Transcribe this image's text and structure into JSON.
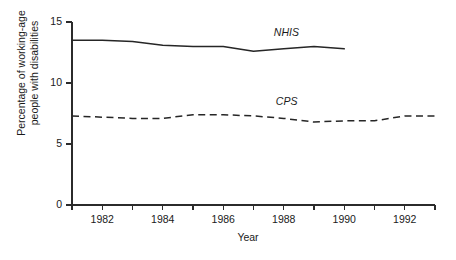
{
  "chart_data": {
    "type": "line",
    "title": "",
    "xlabel": "Year",
    "ylabel_line1": "Percentage of working-age",
    "ylabel_line2": "people with disabilities",
    "xlim": [
      1981,
      1993
    ],
    "ylim": [
      0,
      15
    ],
    "grid": false,
    "legend": "inline-annotations",
    "yticks": [
      "0",
      "5",
      "10",
      "15"
    ],
    "ytick_values": [
      0,
      5,
      10,
      15
    ],
    "xticks": [
      "1982",
      "1984",
      "1986",
      "1988",
      "1990",
      "1992"
    ],
    "xtick_values": [
      1982,
      1984,
      1986,
      1988,
      1990,
      1992
    ],
    "xminor_values": [
      1981,
      1983,
      1985,
      1987,
      1989,
      1991,
      1993
    ],
    "series": [
      {
        "name": "NHIS",
        "style": "solid",
        "label": "NHIS",
        "x": [
          1981,
          1982,
          1983,
          1984,
          1985,
          1986,
          1987,
          1988,
          1989,
          1990
        ],
        "values": [
          13.5,
          13.5,
          13.4,
          13.1,
          13.0,
          13.0,
          12.6,
          12.8,
          13.0,
          12.8
        ]
      },
      {
        "name": "CPS",
        "style": "dashed",
        "label": "CPS",
        "x": [
          1981,
          1982,
          1983,
          1984,
          1985,
          1986,
          1987,
          1988,
          1989,
          1990,
          1991,
          1992,
          1993
        ],
        "values": [
          7.3,
          7.2,
          7.1,
          7.1,
          7.4,
          7.4,
          7.3,
          7.1,
          6.8,
          6.9,
          6.9,
          7.3,
          7.3
        ]
      }
    ]
  },
  "colors": {
    "line": "#262626",
    "axis": "#2b2b2b",
    "background": "#ffffff"
  }
}
